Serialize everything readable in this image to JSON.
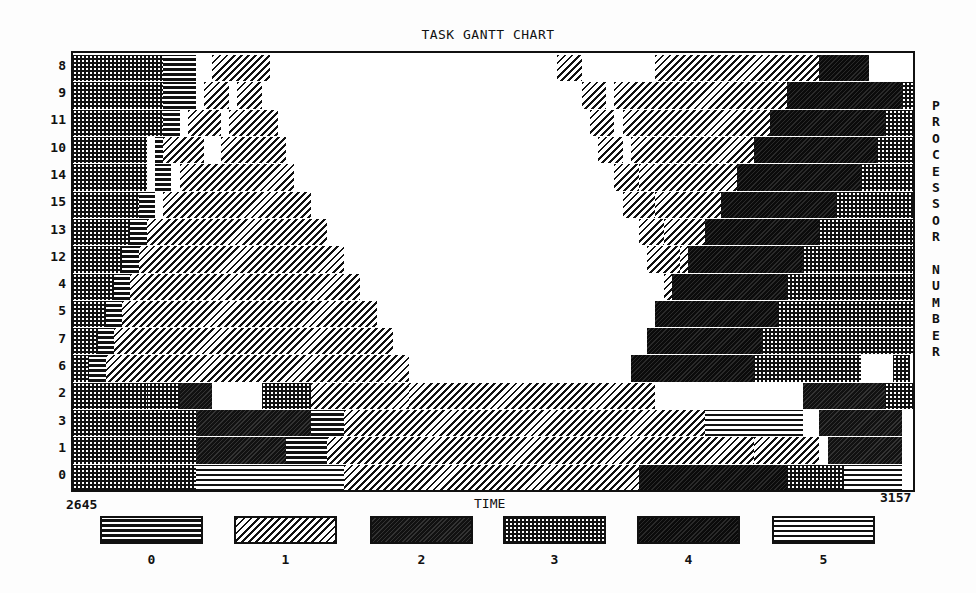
{
  "chart_data": {
    "type": "gantt",
    "title": "TASK GANTT CHART",
    "xlabel": "TIME",
    "ylabel": "PROCESSOR NUMBER",
    "xlim": [
      2645,
      3157
    ],
    "x_tick_labels": [
      "2645",
      "3157"
    ],
    "rows_top_to_bottom": [
      "8",
      "9",
      "11",
      "10",
      "14",
      "15",
      "13",
      "12",
      "4",
      "5",
      "7",
      "6",
      "2",
      "3",
      "1",
      "0"
    ],
    "legend": [
      {
        "label": "0",
        "pattern": "horizontal-lines-dense"
      },
      {
        "label": "1",
        "pattern": "diagonal-hatch"
      },
      {
        "label": "2",
        "pattern": "dark-diagonal"
      },
      {
        "label": "3",
        "pattern": "dotted-dark"
      },
      {
        "label": "4",
        "pattern": "solid-dark-diagonal"
      },
      {
        "label": "5",
        "pattern": "horizontal-lines-light"
      }
    ],
    "grid": false,
    "legend_position": "bottom",
    "segments": [
      {
        "row": "8",
        "tasks": [
          [
            2645,
            2700,
            3
          ],
          [
            2700,
            2720,
            0
          ],
          [
            2730,
            2765,
            1
          ],
          [
            2940,
            2955,
            1
          ],
          [
            3000,
            3100,
            1
          ],
          [
            3100,
            3130,
            4
          ],
          [
            3190,
            3200,
            3
          ]
        ]
      },
      {
        "row": "9",
        "tasks": [
          [
            2645,
            2700,
            3
          ],
          [
            2700,
            2720,
            0
          ],
          [
            2725,
            2740,
            1
          ],
          [
            2745,
            2760,
            1
          ],
          [
            2955,
            2970,
            1
          ],
          [
            2975,
            3080,
            1
          ],
          [
            3080,
            3150,
            4
          ],
          [
            3150,
            3160,
            3
          ]
        ]
      },
      {
        "row": "11",
        "tasks": [
          [
            2645,
            2700,
            3
          ],
          [
            2700,
            2710,
            0
          ],
          [
            2715,
            2735,
            1
          ],
          [
            2740,
            2770,
            1
          ],
          [
            2960,
            2975,
            1
          ],
          [
            2980,
            3070,
            1
          ],
          [
            3070,
            3140,
            4
          ],
          [
            3140,
            3175,
            3
          ]
        ]
      },
      {
        "row": "10",
        "tasks": [
          [
            2645,
            2690,
            3
          ],
          [
            2695,
            2700,
            0
          ],
          [
            2700,
            2725,
            1
          ],
          [
            2735,
            2775,
            1
          ],
          [
            2965,
            2980,
            1
          ],
          [
            2985,
            3060,
            1
          ],
          [
            3060,
            3135,
            4
          ],
          [
            3135,
            3190,
            3
          ]
        ]
      },
      {
        "row": "14",
        "tasks": [
          [
            2645,
            2690,
            3
          ],
          [
            2695,
            2705,
            0
          ],
          [
            2710,
            2780,
            1
          ],
          [
            2975,
            2990,
            1
          ],
          [
            2990,
            3050,
            1
          ],
          [
            3050,
            3125,
            4
          ],
          [
            3125,
            3200,
            3
          ]
        ]
      },
      {
        "row": "15",
        "tasks": [
          [
            2645,
            2685,
            3
          ],
          [
            2685,
            2695,
            0
          ],
          [
            2700,
            2790,
            1
          ],
          [
            2980,
            3000,
            1
          ],
          [
            3000,
            3040,
            1
          ],
          [
            3040,
            3110,
            4
          ],
          [
            3110,
            3210,
            3
          ]
        ]
      },
      {
        "row": "13",
        "tasks": [
          [
            2645,
            2680,
            3
          ],
          [
            2680,
            2690,
            0
          ],
          [
            2690,
            2800,
            1
          ],
          [
            2990,
            3005,
            1
          ],
          [
            3005,
            3030,
            1
          ],
          [
            3030,
            3100,
            4
          ],
          [
            3100,
            3220,
            3
          ]
        ]
      },
      {
        "row": "12",
        "tasks": [
          [
            2645,
            2675,
            3
          ],
          [
            2675,
            2685,
            0
          ],
          [
            2685,
            2810,
            1
          ],
          [
            2995,
            3015,
            1
          ],
          [
            3015,
            3020,
            1
          ],
          [
            3020,
            3090,
            4
          ],
          [
            3090,
            3225,
            3
          ]
        ]
      },
      {
        "row": "4",
        "tasks": [
          [
            2645,
            2670,
            3
          ],
          [
            2670,
            2680,
            0
          ],
          [
            2680,
            2820,
            1
          ],
          [
            3005,
            3020,
            1
          ],
          [
            3010,
            3080,
            4
          ],
          [
            3080,
            3230,
            3
          ]
        ]
      },
      {
        "row": "5",
        "tasks": [
          [
            2645,
            2665,
            3
          ],
          [
            2665,
            2675,
            0
          ],
          [
            2675,
            2830,
            1
          ],
          [
            3010,
            3025,
            1
          ],
          [
            3000,
            3075,
            4
          ],
          [
            3075,
            3235,
            3
          ]
        ]
      },
      {
        "row": "7",
        "tasks": [
          [
            2645,
            2660,
            3
          ],
          [
            2660,
            2670,
            0
          ],
          [
            2670,
            2840,
            1
          ],
          [
            3020,
            3040,
            1
          ],
          [
            2995,
            3065,
            4
          ],
          [
            3065,
            3240,
            3
          ]
        ]
      },
      {
        "row": "6",
        "tasks": [
          [
            2645,
            2655,
            3
          ],
          [
            2655,
            2665,
            0
          ],
          [
            2665,
            2850,
            1
          ],
          [
            2985,
            3060,
            4
          ],
          [
            3060,
            3125,
            3
          ],
          [
            3145,
            3155,
            3
          ]
        ]
      },
      {
        "row": "2",
        "tasks": [
          [
            2645,
            2690,
            3
          ],
          [
            2690,
            2710,
            3
          ],
          [
            2710,
            2730,
            2
          ],
          [
            2760,
            2790,
            3
          ],
          [
            2790,
            2850,
            1
          ],
          [
            2850,
            3000,
            1
          ],
          [
            3090,
            3140,
            2
          ],
          [
            3140,
            3157,
            3
          ]
        ]
      },
      {
        "row": "3",
        "tasks": [
          [
            2645,
            2720,
            3
          ],
          [
            2720,
            2790,
            2
          ],
          [
            2790,
            2810,
            0
          ],
          [
            2810,
            3030,
            1
          ],
          [
            3030,
            3090,
            5
          ],
          [
            3100,
            3150,
            2
          ]
        ]
      },
      {
        "row": "1",
        "tasks": [
          [
            2645,
            2720,
            3
          ],
          [
            2720,
            2775,
            2
          ],
          [
            2775,
            2800,
            0
          ],
          [
            2800,
            3060,
            1
          ],
          [
            3060,
            3100,
            1
          ],
          [
            3105,
            3150,
            2
          ]
        ]
      },
      {
        "row": "0",
        "tasks": [
          [
            2645,
            2720,
            3
          ],
          [
            2720,
            2810,
            5
          ],
          [
            2810,
            2990,
            1
          ],
          [
            2990,
            3080,
            4
          ],
          [
            3080,
            3115,
            3
          ],
          [
            3115,
            3150,
            5
          ]
        ]
      }
    ]
  },
  "ui": {
    "title": "TASK GANTT CHART",
    "xlabel": "TIME",
    "x_min": "2645",
    "x_max": "3157",
    "ylabel_letters": [
      "P",
      "R",
      "O",
      "C",
      "E",
      "S",
      "S",
      "O",
      "R",
      " ",
      "N",
      "U",
      "M",
      "B",
      "E",
      "R"
    ]
  }
}
